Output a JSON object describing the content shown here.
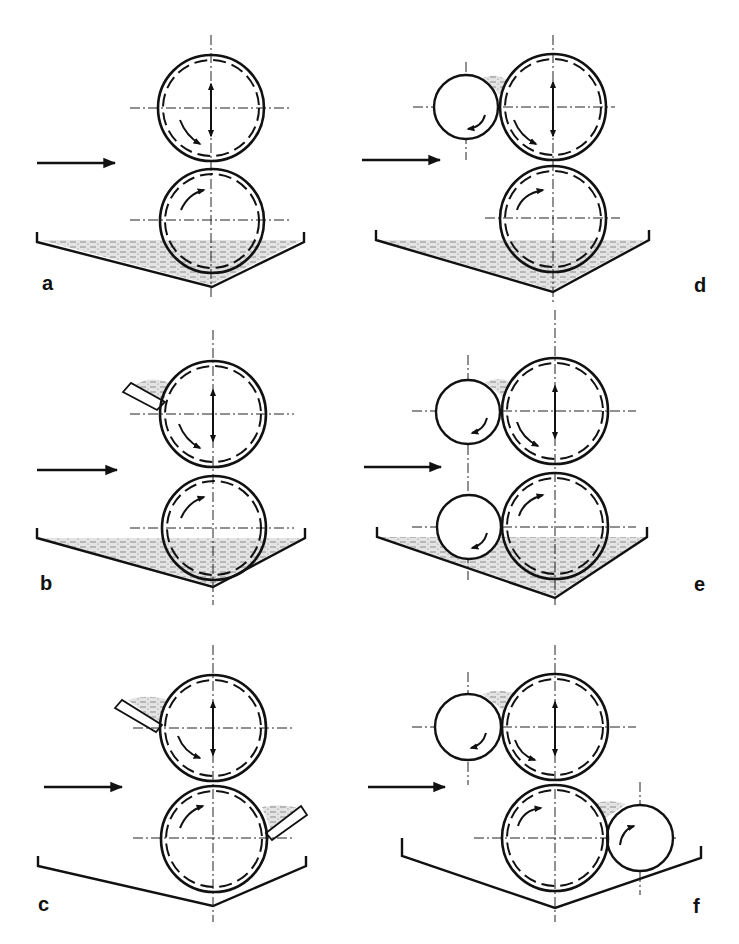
{
  "figure": {
    "panels": [
      {
        "label": "a",
        "configuration": "two rolls, bottom roll dips in filled tray"
      },
      {
        "label": "b",
        "configuration": "two rolls, filled tray, doctor blade reservoir on upper roll"
      },
      {
        "label": "c",
        "configuration": "two rolls, empty tray, doctor blade reservoirs on both rolls"
      },
      {
        "label": "d",
        "configuration": "three rolls: small metering roll on upper roll, bottom roll in filled tray"
      },
      {
        "label": "e",
        "configuration": "four rolls: small metering rolls on both, filled tray"
      },
      {
        "label": "f",
        "configuration": "four rolls: metering rolls upper-left and lower-right, empty tray"
      }
    ],
    "colors": {
      "line": "#111111",
      "background": "#ffffff",
      "liquid": "#9a9a9a"
    }
  }
}
